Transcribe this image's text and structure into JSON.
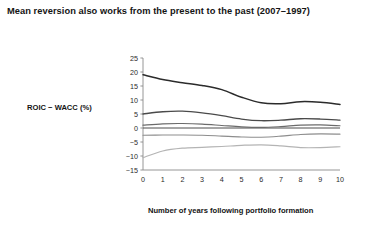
{
  "title": "Mean reversion also works from the present to the past (2007–1997)",
  "chart_data": {
    "type": "line",
    "title": "Mean reversion also works from the present to the past (2007–1997)",
    "xlabel": "Number of years following portfolio formation",
    "ylabel": "ROIC − WACC (%)",
    "xlim": [
      0,
      10
    ],
    "ylim": [
      -15,
      25
    ],
    "x": [
      0,
      1,
      2,
      3,
      4,
      5,
      6,
      7,
      8,
      9,
      10
    ],
    "xticks": [
      "0",
      "1",
      "2",
      "3",
      "4",
      "5",
      "6",
      "7",
      "8",
      "9",
      "10"
    ],
    "yticks": [
      "25",
      "20",
      "15",
      "10",
      "5",
      "0",
      "-5",
      "-10",
      "-15"
    ],
    "grid": false,
    "legend": "none",
    "zero_line": true,
    "series": [
      {
        "name": "Top quintile",
        "color": "#2b2b2b",
        "width": 1.5,
        "values": [
          19.0,
          17.3,
          16.2,
          15.2,
          13.7,
          11.0,
          9.0,
          8.7,
          9.4,
          9.2,
          8.4
        ]
      },
      {
        "name": "Second quintile",
        "color": "#4a4a4a",
        "width": 1.3,
        "values": [
          5.0,
          5.8,
          6.0,
          5.4,
          4.4,
          3.2,
          2.6,
          2.8,
          3.3,
          3.2,
          2.8
        ]
      },
      {
        "name": "Third quintile",
        "color": "#6b6b6b",
        "width": 1.2,
        "values": [
          1.0,
          1.5,
          1.6,
          1.4,
          0.9,
          0.4,
          0.2,
          0.5,
          1.0,
          1.1,
          0.8
        ]
      },
      {
        "name": "Fourth quintile",
        "color": "#8d8d8d",
        "width": 1.1,
        "values": [
          -2.6,
          -2.5,
          -2.5,
          -2.6,
          -2.9,
          -3.2,
          -3.3,
          -2.9,
          -2.3,
          -2.1,
          -2.2
        ]
      },
      {
        "name": "Bottom quintile",
        "color": "#b4b4b4",
        "width": 1.2,
        "values": [
          -10.6,
          -8.2,
          -7.2,
          -6.9,
          -6.6,
          -6.2,
          -6.0,
          -6.4,
          -7.0,
          -7.0,
          -6.7
        ]
      }
    ]
  }
}
